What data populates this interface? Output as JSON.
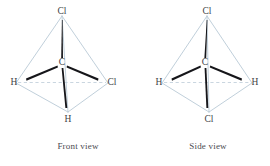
{
  "figure": {
    "colors": {
      "background": "#ffffff",
      "tetrahedron_edge": "#b9c9d6",
      "dashed_axis": "#bcccd8",
      "bond_wedge": "#16161a",
      "label_text": "#3e3e44",
      "caption_text": "#4a4a50"
    }
  },
  "panels": [
    {
      "id": "front-view",
      "caption": "Front view",
      "center_atom": {
        "label": "C",
        "x": 62,
        "y": 63
      },
      "vertices": [
        {
          "id": "apex",
          "label": "Cl",
          "x": 62,
          "y": 12,
          "label_x": 62,
          "label_y": 12
        },
        {
          "id": "left",
          "label": "H",
          "x": 16,
          "y": 83,
          "label_x": 14,
          "label_y": 83
        },
        {
          "id": "right",
          "label": "Cl",
          "x": 108,
          "y": 83,
          "label_x": 112,
          "label_y": 83
        },
        {
          "id": "bottom",
          "label": "H",
          "x": 68,
          "y": 112,
          "label_x": 68,
          "label_y": 120
        }
      ]
    },
    {
      "id": "side-view",
      "caption": "Side view",
      "center_atom": {
        "label": "C",
        "x": 70,
        "y": 63
      },
      "vertices": [
        {
          "id": "apex",
          "label": "Cl",
          "x": 72,
          "y": 12,
          "label_x": 72,
          "label_y": 12
        },
        {
          "id": "left",
          "label": "H",
          "x": 27,
          "y": 83,
          "label_x": 24,
          "label_y": 83
        },
        {
          "id": "right",
          "label": "H",
          "x": 117,
          "y": 83,
          "label_x": 120,
          "label_y": 83
        },
        {
          "id": "bottom",
          "label": "Cl",
          "x": 74,
          "y": 112,
          "label_x": 74,
          "label_y": 120
        }
      ]
    }
  ]
}
